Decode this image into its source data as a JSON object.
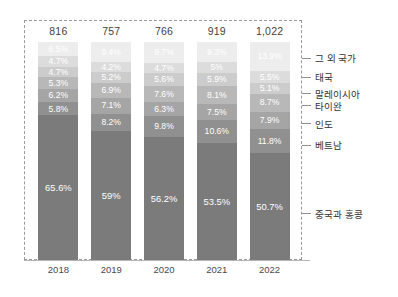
{
  "chart_data": {
    "type": "bar",
    "subtype": "stacked-column-100pct",
    "title": "",
    "xlabel": "",
    "ylabel": "",
    "categories": [
      "2018",
      "2019",
      "2020",
      "2021",
      "2022"
    ],
    "totals": [
      "816",
      "757",
      "766",
      "919",
      "1,022"
    ],
    "grid": false,
    "legend_position": "right",
    "series": [
      {
        "name": "중국과 홍콩",
        "color": "#7b7b7b",
        "values": [
          65.6,
          59,
          56.2,
          53.5,
          50.7
        ],
        "labels": [
          "65.6%",
          "59%",
          "56.2%",
          "53.5%",
          "50.7%"
        ]
      },
      {
        "name": "베트남",
        "color": "#909090",
        "values": [
          5.8,
          8.2,
          9.8,
          10.6,
          11.8
        ],
        "labels": [
          "5.8%",
          "8.2%",
          "9.8%",
          "10.6%",
          "11.8%"
        ]
      },
      {
        "name": "인도",
        "color": "#a5a5a5",
        "values": [
          6.2,
          7.1,
          6.3,
          7.5,
          7.9
        ],
        "labels": [
          "6.2%",
          "7.1%",
          "6.3%",
          "7.5%",
          "7.9%"
        ]
      },
      {
        "name": "타이완",
        "color": "#b8b8b8",
        "values": [
          5.3,
          6.9,
          7.6,
          8.1,
          8.7
        ],
        "labels": [
          "5.3%",
          "6.9%",
          "7.6%",
          "8.1%",
          "8.7%"
        ]
      },
      {
        "name": "말레이시아",
        "color": "#cccccc",
        "values": [
          4.7,
          5.2,
          5.6,
          5.9,
          5.1
        ],
        "labels": [
          "4.7%",
          "5.2%",
          "5.6%",
          "5.9%",
          "5.1%"
        ]
      },
      {
        "name": "태국",
        "color": "#dcdcdc",
        "values": [
          4.7,
          4.2,
          4.7,
          5.0,
          5.5
        ],
        "labels": [
          "4.7%",
          "4.2%",
          "4.7%",
          "5%",
          "5.5%"
        ]
      },
      {
        "name": "그 외 국가",
        "color": "#ededed",
        "values": [
          6.5,
          9.4,
          9.7,
          9.3,
          13.9
        ],
        "labels": [
          "6.5%",
          "9.4%",
          "9.7%",
          "9.3%",
          "13.9%"
        ]
      }
    ]
  },
  "legend": {
    "items": [
      {
        "label": "그 외 국가"
      },
      {
        "label": "태국"
      },
      {
        "label": "말레이시아"
      },
      {
        "label": "타이완"
      },
      {
        "label": "인도"
      },
      {
        "label": "베트남"
      },
      {
        "label": "중국과 홍콩"
      }
    ]
  },
  "colors": {
    "background": "#ffffff",
    "frame_border": "#9a9a9a",
    "axis": "#b5b5b5",
    "total_text": "#3f3f3f",
    "tick_text": "#4a4a4a",
    "legend_text": "#333333",
    "segment_label_light": "#ffffff"
  }
}
